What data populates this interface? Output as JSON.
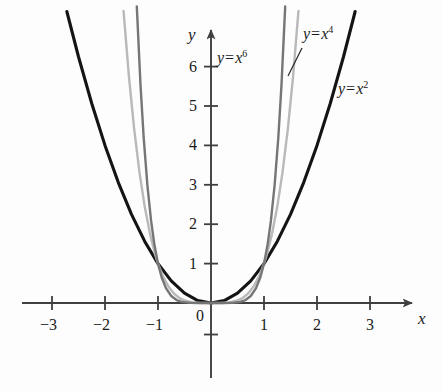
{
  "figure": {
    "kind": "graph",
    "background_color": "#fdfdfd"
  },
  "axes": {
    "x_axis_name": "x",
    "y_axis_name": "y",
    "origin_label": "0",
    "x_ticks": [
      {
        "value": -3,
        "label": "−3"
      },
      {
        "value": -2,
        "label": "−2"
      },
      {
        "value": -1,
        "label": "−1"
      },
      {
        "value": 1,
        "label": "1"
      },
      {
        "value": 2,
        "label": "2"
      },
      {
        "value": 3,
        "label": "3"
      }
    ],
    "y_ticks": [
      {
        "value": 1,
        "label": "1"
      },
      {
        "value": 2,
        "label": "2"
      },
      {
        "value": 3,
        "label": "3"
      },
      {
        "value": 4,
        "label": "4"
      },
      {
        "value": 5,
        "label": "5"
      },
      {
        "value": 6,
        "label": "6"
      }
    ]
  },
  "curve_labels": {
    "x2": {
      "lhs": "y",
      "eq": "=",
      "base": "x",
      "exp": "2",
      "full": "y = x²"
    },
    "x4": {
      "lhs": "y",
      "eq": "=",
      "base": "x",
      "exp": "4",
      "full": "y = x⁴"
    },
    "x6": {
      "lhs": "y",
      "eq": "=",
      "base": "x",
      "exp": "6",
      "full": "y = x⁶"
    }
  },
  "colors": {
    "axis": "#3f3f3f",
    "x2_curve": "#141414",
    "x4_curve": "#b9b9b9",
    "x6_curve": "#767676",
    "text": "#1b1b1b"
  },
  "chart_data": {
    "type": "line",
    "title": "",
    "subtitle": "",
    "xlabel": "x",
    "ylabel": "y",
    "xlim": [
      -3.6,
      3.6
    ],
    "ylim": [
      -0.6,
      7.4
    ],
    "xticks": [
      -3,
      -2,
      -1,
      1,
      2,
      3
    ],
    "yticks": [
      1,
      2,
      3,
      4,
      5,
      6
    ],
    "grid": false,
    "legend": "inline-annotations",
    "annotations": [
      {
        "text": "y = x²",
        "x": 2.95,
        "y": 6.3,
        "target_curve": "y = x^2"
      },
      {
        "text": "y = x⁴",
        "x": 1.85,
        "y": 7.05,
        "target_curve": "y = x^4",
        "leader_line": true
      },
      {
        "text": "y = x⁶",
        "x": 0.35,
        "y": 6.55,
        "target_curve": "y = x^6"
      }
    ],
    "series": [
      {
        "name": "y = x^2",
        "expression": "x^2",
        "color": "#141414",
        "linewidth": 3.1,
        "x": [
          -2.72,
          -2.5,
          -2.25,
          -2.0,
          -1.75,
          -1.5,
          -1.25,
          -1.0,
          -0.75,
          -0.5,
          -0.25,
          0,
          0.25,
          0.5,
          0.75,
          1.0,
          1.25,
          1.5,
          1.75,
          2.0,
          2.25,
          2.5,
          2.72
        ],
        "values": [
          7.3984,
          6.25,
          5.0625,
          4.0,
          3.0625,
          2.25,
          1.5625,
          1.0,
          0.5625,
          0.25,
          0.0625,
          0,
          0.0625,
          0.25,
          0.5625,
          1.0,
          1.5625,
          2.25,
          3.0625,
          4.0,
          5.0625,
          6.25,
          7.3984
        ]
      },
      {
        "name": "y = x^4",
        "expression": "x^4",
        "color": "#b9b9b9",
        "linewidth": 2.4,
        "x": [
          -1.65,
          -1.55,
          -1.45,
          -1.35,
          -1.25,
          -1.15,
          -1.05,
          -1.0,
          -0.9,
          -0.8,
          -0.7,
          -0.6,
          -0.5,
          -0.35,
          -0.2,
          0,
          0.2,
          0.35,
          0.5,
          0.6,
          0.7,
          0.8,
          0.9,
          1.0,
          1.05,
          1.15,
          1.25,
          1.35,
          1.45,
          1.55,
          1.65
        ],
        "values": [
          7.412,
          5.772,
          4.4205,
          3.3215,
          2.4414,
          1.749,
          1.2155,
          1.0,
          0.6561,
          0.4096,
          0.2401,
          0.1296,
          0.0625,
          0.015,
          0.0016,
          0,
          0.0016,
          0.015,
          0.0625,
          0.1296,
          0.2401,
          0.4096,
          0.6561,
          1.0,
          1.2155,
          1.749,
          2.4414,
          3.3215,
          4.4205,
          5.772,
          7.412
        ]
      },
      {
        "name": "y = x^6",
        "expression": "x^6",
        "color": "#767676",
        "linewidth": 2.4,
        "x": [
          -1.4,
          -1.33,
          -1.27,
          -1.2,
          -1.13,
          -1.07,
          -1.0,
          -0.93,
          -0.85,
          -0.75,
          -0.65,
          -0.55,
          -0.4,
          -0.25,
          0,
          0.25,
          0.4,
          0.55,
          0.65,
          0.75,
          0.85,
          0.93,
          1.0,
          1.07,
          1.13,
          1.2,
          1.27,
          1.33,
          1.4
        ],
        "values": [
          7.5295,
          5.5329,
          4.1959,
          2.986,
          2.082,
          1.5007,
          1.0,
          0.647,
          0.3771,
          0.178,
          0.0754,
          0.0277,
          0.0041,
          0.0002,
          0,
          0.0002,
          0.0041,
          0.0277,
          0.0754,
          0.178,
          0.3771,
          0.647,
          1.0,
          1.5007,
          2.082,
          2.986,
          4.1959,
          5.5329,
          7.5295
        ]
      }
    ]
  }
}
